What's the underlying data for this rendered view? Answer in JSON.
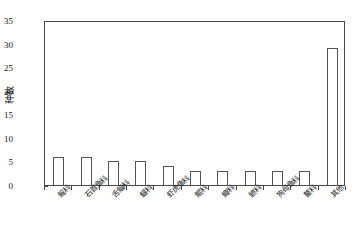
{
  "chart_data": {
    "type": "bar",
    "title": "",
    "xlabel": "",
    "ylabel": "种数",
    "categories": [
      "鳐科",
      "石首鱼科",
      "舌鲾科",
      "鳀科",
      "虾虎鱼科",
      "鲲科",
      "鲰科",
      "鲼科",
      "狗母鱼科",
      "鳌科",
      "其他"
    ],
    "values": [
      6,
      6,
      5,
      5,
      4,
      3,
      3,
      3,
      3,
      3,
      29
    ],
    "ylim": [
      0,
      35
    ],
    "yticks": [
      0,
      5,
      10,
      15,
      20,
      25,
      30,
      35
    ],
    "ytick_labels": [
      "0",
      "5",
      "10",
      "15",
      "20",
      "25",
      "30",
      "35"
    ],
    "grid": false,
    "legend": null,
    "bar_fill_color": "#ffffff",
    "bar_edge_color": "#555555",
    "axis_color": "#4a4a4a",
    "text_color": "#1a1a1a"
  }
}
